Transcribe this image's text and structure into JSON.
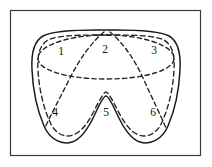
{
  "figure": {
    "background_color": "#ffffff",
    "frame": {
      "name": "outer-border",
      "stroke_color": "#3b3b3b",
      "stroke_width": 1.1,
      "x": 10.5,
      "y": 10.5,
      "width": 190,
      "height": 145
    },
    "outer_boundary": {
      "name": "solid-domain-outline",
      "style": "solid",
      "stroke_color": "#1a1a1a",
      "stroke_width": 1.5,
      "path": "M 97 30 C 72 30 52 31 43 36 C 34 41 31 52 32 70 C 33 92 38 112 44 126 C 50 140 62 145 72 142 C 82 139 89 127 95 114 C 100 103 104 96 106 96 C 108 96 112 103 117 114 C 123 127 130 139 140 142 C 150 145 162 140 168 126 C 174 112 179 92 180 70 C 181 52 178 41 169 36 C 160 31 140 30 115 30 Z"
    },
    "inner_boundary": {
      "name": "dashed-offset-contour",
      "style": "dashed",
      "stroke_color": "#222222",
      "stroke_width": 1.35,
      "dash_pattern": "5 3.4",
      "path": "M 97 35 C 74 35 56 36 48 40 C 40 45 37 54 38 70 C 39 90 44 109 50 122 C 55 134 65 138 73 135 C 82 132 89 121 95 109 C 100 99 104 92 106 92 C 108 92 112 99 117 109 C 123 121 130 132 139 135 C 147 138 157 134 162 122 C 168 109 173 90 174 70 C 175 54 172 45 164 40 C 156 36 138 35 115 35 Z"
    },
    "dividing_curves": [
      {
        "name": "horizontal-ellipse-divider",
        "style": "dashed",
        "description": "Wide flattened oval across the upper portion separating regions 1-2-3 from regions 4-5-6",
        "path": "M 106 35 C 70 35 40 45 38 57 C 36 69 64 79 106 79 C 148 79 176 69 174 57 C 172 45 142 35 106 35 Z"
      },
      {
        "name": "left-diagonal-divider",
        "style": "dashed",
        "description": "Dashed arc from the top-center notch sweeping down-left to the lower-left lobe, separating region 1 from 2 and region 4 from 5",
        "path": "M 104 32 C 92 42 80 58 70 78 C 60 98 50 116 45 128"
      },
      {
        "name": "right-diagonal-divider",
        "style": "dashed",
        "description": "Dashed arc from the top-center notch sweeping down-right to the lower-right lobe, separating region 3 from 2 and region 6 from 5",
        "path": "M 110 32 C 122 42 134 58 143 78 C 152 98 161 116 166 128"
      }
    ],
    "regions": [
      {
        "id": "region-1",
        "label": "1",
        "x": 61,
        "y": 52
      },
      {
        "id": "region-2",
        "label": "2",
        "x": 105,
        "y": 50
      },
      {
        "id": "region-3",
        "label": "3",
        "x": 154,
        "y": 51
      },
      {
        "id": "region-4",
        "label": "4",
        "x": 55,
        "y": 113
      },
      {
        "id": "region-5",
        "label": "5",
        "x": 106,
        "y": 113
      },
      {
        "id": "region-6",
        "label": "6",
        "x": 153,
        "y": 113
      }
    ]
  }
}
